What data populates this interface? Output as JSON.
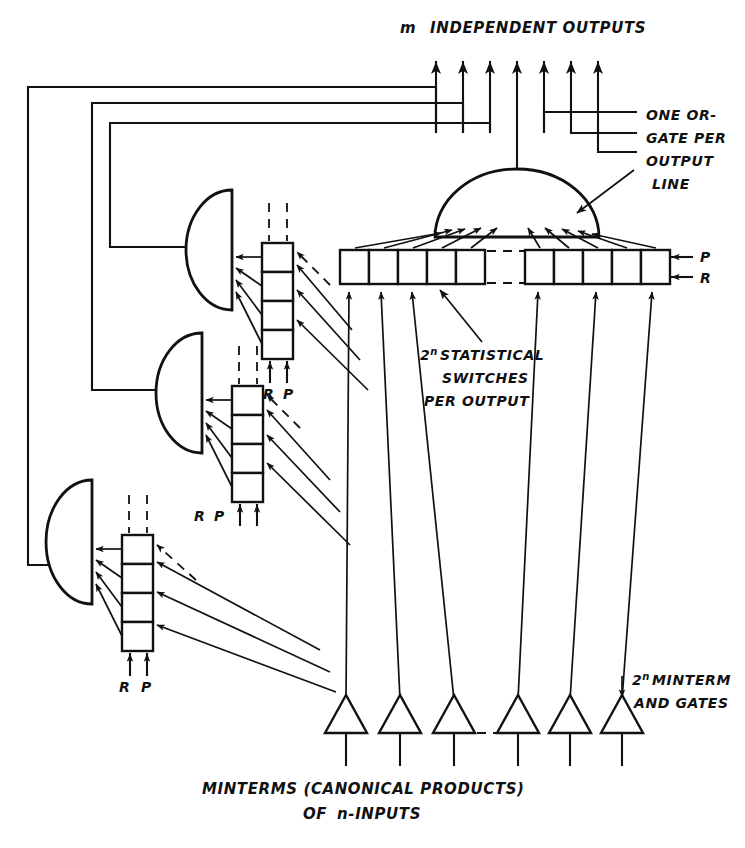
{
  "figure": {
    "title_top": "INDEPENDENT OUTPUTS",
    "title_top_prefix": "m",
    "annotations": {
      "or_gate_note": [
        "ONE OR-",
        "GATE PER",
        "OUTPUT",
        "LINE"
      ],
      "switches_note_prefix": "2",
      "switches_note_sup": "n",
      "switches_note": [
        "STATISTICAL",
        "SWITCHES",
        "PER OUTPUT"
      ],
      "minterm_note_prefix": "2",
      "minterm_note_sup": "n",
      "minterm_note": [
        "MINTERM",
        "AND GATES"
      ]
    },
    "caption": {
      "line1": "MINTERMS (CANONICAL PRODUCTS)",
      "line2_prefix": "OF ",
      "line2_italic_n": "n",
      "line2_suffix": "-INPUTS"
    },
    "signal_labels": {
      "reset": "R",
      "probability": "P"
    },
    "right_bar_labels": {
      "top": "P",
      "bottom": "R"
    },
    "switch_stacks": [
      {
        "id": "stack-1",
        "reset": "R",
        "probability": "P",
        "boxes": 4
      },
      {
        "id": "stack-2",
        "reset": "R",
        "probability": "P",
        "boxes": 4
      },
      {
        "id": "stack-3",
        "reset": "R",
        "probability": "P",
        "boxes": 4
      }
    ],
    "main_switch_bar": {
      "left_group_boxes": 5,
      "right_group_boxes": 5,
      "gap_is_dashed": true
    },
    "minterm_gates_count": 6,
    "output_arrows_count": 7,
    "or_gates_count": 4,
    "colors": {
      "ink": "#111111",
      "paper": "#ffffff"
    }
  }
}
